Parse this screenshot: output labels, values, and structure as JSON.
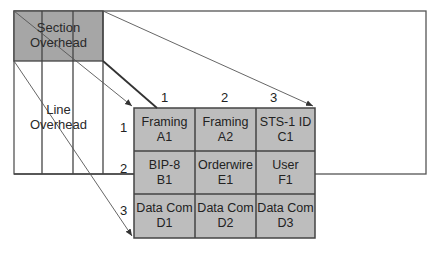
{
  "diagram": {
    "section_overhead_label": [
      "Section",
      "Overhead"
    ],
    "line_overhead_label": [
      "Line",
      "Overhead"
    ],
    "column_numbers": [
      "1",
      "2",
      "3"
    ],
    "row_numbers": [
      "1",
      "2",
      "3"
    ],
    "cells": [
      [
        {
          "name": "Framing",
          "code": "A1"
        },
        {
          "name": "Framing",
          "code": "A2"
        },
        {
          "name": "STS-1 ID",
          "code": "C1"
        }
      ],
      [
        {
          "name": "BIP-8",
          "code": "B1"
        },
        {
          "name": "Orderwire",
          "code": "E1"
        },
        {
          "name": "User",
          "code": "F1"
        }
      ],
      [
        {
          "name": "Data Com",
          "code": "D1"
        },
        {
          "name": "Data Com",
          "code": "D2"
        },
        {
          "name": "Data Com",
          "code": "D3"
        }
      ]
    ],
    "colors": {
      "section_fill": "#a6a6a6",
      "cell_fill": "#bdbdbd",
      "line": "#444444"
    }
  }
}
